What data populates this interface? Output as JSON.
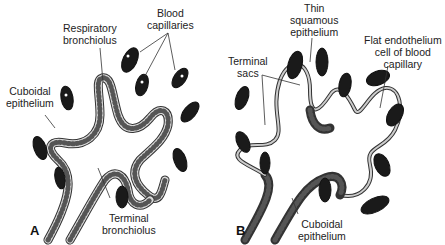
{
  "figure": {
    "panel_a": {
      "letter": "A",
      "labels": {
        "respiratory_bronchiolus": "Respiratory\nbronchiolus",
        "blood_capillaries": "Blood\ncapillaries",
        "cuboidal_epithelium": "Cuboidal\nepithelium",
        "terminal_bronchiolus": "Terminal\nbronchiolus"
      }
    },
    "panel_b": {
      "letter": "B",
      "labels": {
        "thin_squamous_epithelium": "Thin\nsquamous\nepithelium",
        "flat_endothelium": "Flat endothelium\ncell of blood\ncapillary",
        "terminal_sacs": "Terminal\nsacs",
        "cuboidal_epithelium": "Cuboidal\nepithelium"
      }
    }
  }
}
